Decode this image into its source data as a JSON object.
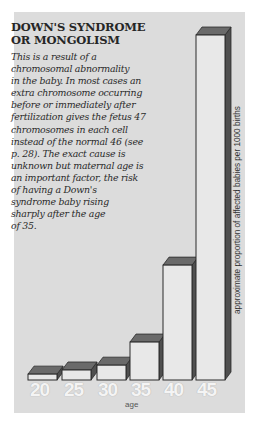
{
  "title_lines": [
    "DOWN'S SYNDROME",
    "OR MONGOLISM"
  ],
  "body_lines": [
    "This is a result of a",
    "chromosomal abnormality",
    "in the baby. In most cases an",
    "extra chromosome occurring",
    "before or immediately after",
    "fertilization gives the fetus 47",
    "chromosomes in each cell",
    "instead of the normal 46 (see",
    "p. 28). The exact cause is",
    "unknown but maternal age is",
    "an important factor, the risk",
    "of having a Down's",
    "syndrome baby rising",
    "sharply after the age",
    "of 35."
  ],
  "colors": {
    "panel": "#dcdcdc",
    "bar_front": "#e8e8e8",
    "bar_top": "#6a6a6a",
    "bar_side": "#4f4f4f",
    "outline": "#2b2b2b"
  },
  "chart_data": {
    "type": "bar",
    "title": "DOWN'S SYNDROME OR MONGOLISM",
    "categories": [
      "20",
      "25",
      "30",
      "35",
      "40",
      "45"
    ],
    "values": [
      1.7,
      2.9,
      4.3,
      11.0,
      33.3,
      100
    ],
    "value_note": "relative bar heights (45 = 100); no numeric axis shown",
    "xlabel": "age",
    "ylabel": "approximate proportion of affected babies per 1000 births",
    "ylim": [
      0,
      100
    ],
    "grid": false,
    "legend": null,
    "style": "3d-bars"
  },
  "axis": {
    "xlabel": "age",
    "ylabel": "approximate proportion of affected babies per 1000 births"
  }
}
